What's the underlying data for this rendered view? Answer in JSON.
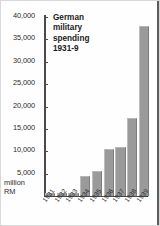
{
  "chart_data": {
    "type": "bar",
    "title": "German military spending 1931-9",
    "title_lines": [
      "German",
      "military",
      "spending",
      "1931-9"
    ],
    "xlabel": "",
    "ylabel": "million RM",
    "ylabel_lines": [
      "million",
      "RM"
    ],
    "ylim": [
      0,
      40000
    ],
    "grid": false,
    "legend": null,
    "categories": [
      "1931",
      "1932",
      "1933",
      "1934",
      "1935",
      "1936",
      "1937",
      "1938",
      "1939"
    ],
    "values": [
      600,
      650,
      700,
      4500,
      5700,
      10400,
      11000,
      17500,
      38000
    ],
    "yticks": [
      0,
      5000,
      10000,
      15000,
      20000,
      25000,
      30000,
      35000,
      40000
    ],
    "ytick_labels": [
      "0",
      "5,000",
      "10,000",
      "15,000",
      "20,000",
      "25,000",
      "30,000",
      "35,000",
      "40,000"
    ],
    "bar_color": "#9a9a9a",
    "axis_color": "#4a4a4a",
    "text_color": "#2b2b2b",
    "background": "#fefefe"
  }
}
